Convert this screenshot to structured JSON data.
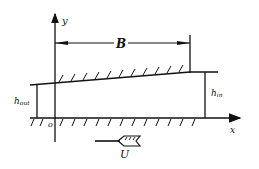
{
  "diagram": {
    "labels": {
      "y_axis": "y",
      "x_axis": "x",
      "origin": "o",
      "width": "B",
      "h_out": "h",
      "h_out_sub": "out",
      "h_in": "h",
      "h_in_sub": "in",
      "velocity": "U"
    },
    "colors": {
      "ink": "#111111",
      "background": "#ffffff"
    }
  }
}
